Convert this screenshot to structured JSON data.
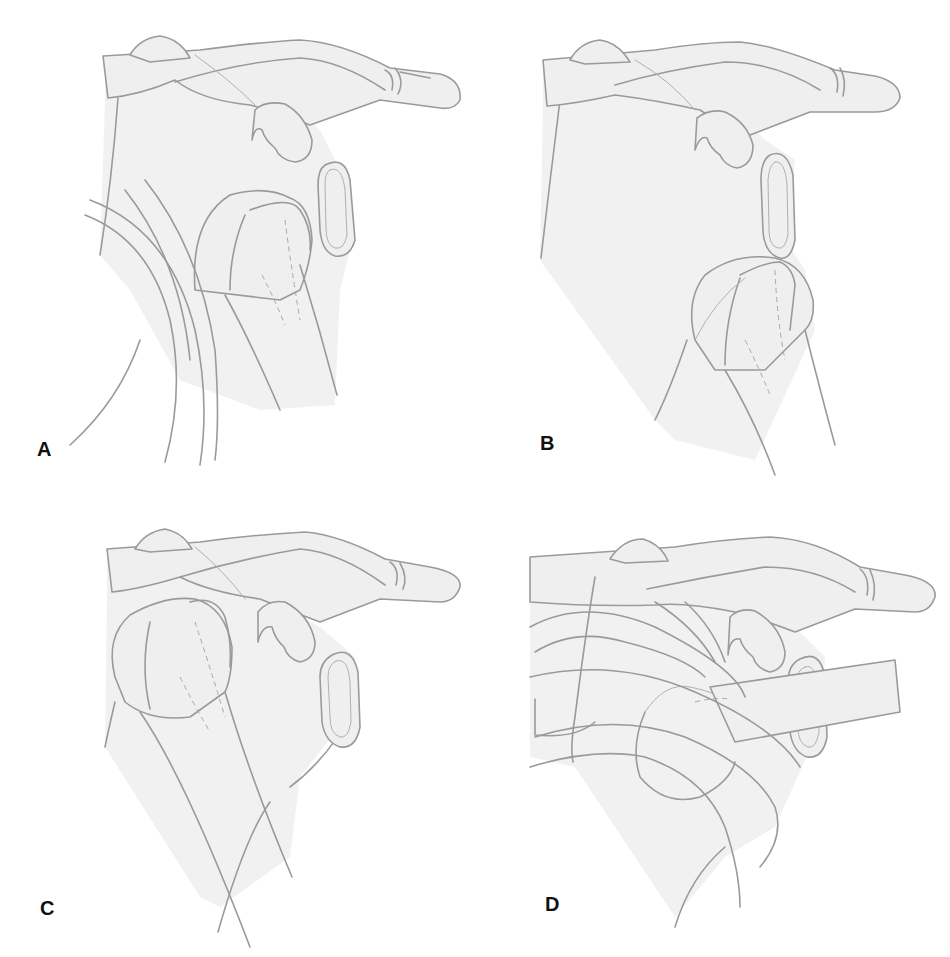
{
  "figure": {
    "panels": [
      {
        "id": "A",
        "label": "A"
      },
      {
        "id": "B",
        "label": "B"
      },
      {
        "id": "C",
        "label": "C"
      },
      {
        "id": "D",
        "label": "D"
      }
    ]
  },
  "colors": {
    "line": "#9a9a9a",
    "shading": "#f1f1f1",
    "label": "#111111",
    "background": "#ffffff"
  }
}
